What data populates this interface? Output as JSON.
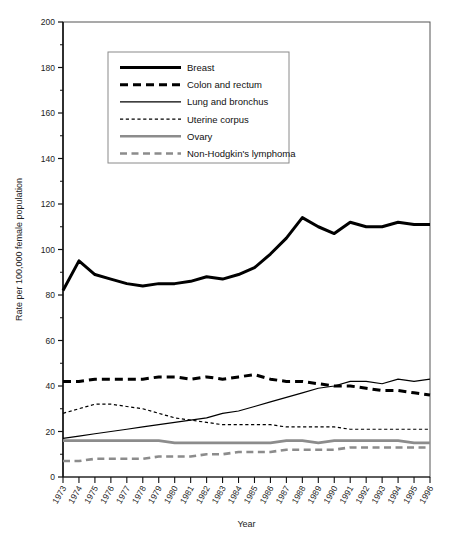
{
  "chart_data": {
    "type": "line",
    "title": "",
    "xlabel": "Year",
    "ylabel": "Rate per 100,000 female population",
    "xlim": [
      1973,
      1996
    ],
    "ylim": [
      0,
      200
    ],
    "ytick_step": 20,
    "grid": false,
    "legend_position": "upper-left-inside",
    "x": [
      1973,
      1974,
      1975,
      1976,
      1977,
      1978,
      1979,
      1980,
      1981,
      1982,
      1983,
      1984,
      1985,
      1986,
      1987,
      1988,
      1989,
      1990,
      1991,
      1992,
      1993,
      1994,
      1995,
      1996
    ],
    "categories": [
      "1973",
      "1974",
      "1975",
      "1976",
      "1977",
      "1978",
      "1979",
      "1980",
      "1981",
      "1982",
      "1983",
      "1984",
      "1985",
      "1986",
      "1987",
      "1988",
      "1989",
      "1990",
      "1991",
      "1992",
      "1993",
      "1994",
      "1995",
      "1996"
    ],
    "yticks": [
      "0",
      "20",
      "40",
      "60",
      "80",
      "100",
      "120",
      "140",
      "160",
      "180",
      "200"
    ],
    "series": [
      {
        "name": "Breast",
        "style": "solid",
        "width": 3.0,
        "color": "#000000",
        "values": [
          82,
          95,
          89,
          87,
          85,
          84,
          85,
          85,
          86,
          88,
          87,
          89,
          92,
          98,
          105,
          114,
          110,
          107,
          112,
          110,
          110,
          112,
          111,
          111
        ]
      },
      {
        "name": "Colon and rectum",
        "style": "dashed",
        "width": 3.0,
        "color": "#000000",
        "values": [
          42,
          42,
          43,
          43,
          43,
          43,
          44,
          44,
          43,
          44,
          43,
          44,
          45,
          43,
          42,
          42,
          41,
          40,
          40,
          39,
          38,
          38,
          37,
          36
        ]
      },
      {
        "name": "Lung and bronchus",
        "style": "solid",
        "width": 1.2,
        "color": "#000000",
        "values": [
          17,
          18,
          19,
          20,
          21,
          22,
          23,
          24,
          25,
          26,
          28,
          29,
          31,
          33,
          35,
          37,
          39,
          40,
          42,
          42,
          41,
          43,
          42,
          43
        ]
      },
      {
        "name": "Uterine corpus",
        "style": "dotted",
        "width": 1.2,
        "color": "#000000",
        "values": [
          28,
          30,
          32,
          32,
          31,
          30,
          28,
          26,
          25,
          24,
          23,
          23,
          23,
          23,
          22,
          22,
          22,
          22,
          21,
          21,
          21,
          21,
          21,
          21
        ]
      },
      {
        "name": "Ovary",
        "style": "solid",
        "width": 2.6,
        "color": "#8c8c8c",
        "values": [
          16,
          16,
          16,
          16,
          16,
          16,
          16,
          15,
          15,
          15,
          15,
          15,
          15,
          15,
          16,
          16,
          15,
          16,
          16,
          16,
          16,
          16,
          15,
          15
        ]
      },
      {
        "name": "Non-Hodgkin's lymphoma",
        "style": "dashed",
        "width": 2.6,
        "color": "#8c8c8c",
        "values": [
          7,
          7,
          8,
          8,
          8,
          8,
          9,
          9,
          9,
          10,
          10,
          11,
          11,
          11,
          12,
          12,
          12,
          12,
          13,
          13,
          13,
          13,
          13,
          13
        ]
      }
    ]
  },
  "legend": {
    "items": [
      {
        "label": "Breast"
      },
      {
        "label": "Colon and rectum"
      },
      {
        "label": "Lung and bronchus"
      },
      {
        "label": "Uterine corpus"
      },
      {
        "label": "Ovary"
      },
      {
        "label": "Non-Hodgkin's lymphoma"
      }
    ]
  }
}
